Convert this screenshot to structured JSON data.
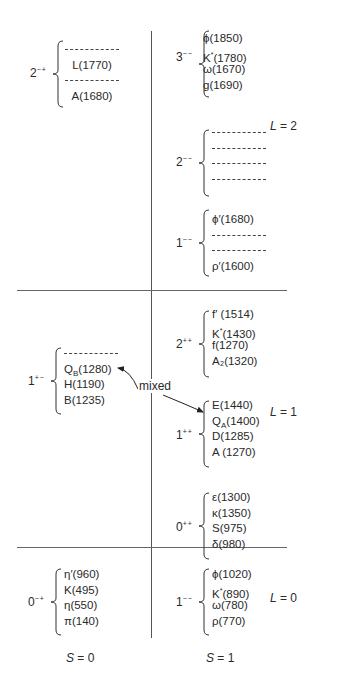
{
  "axes": {
    "spin_labels": [
      "S = 0",
      "S = 1"
    ],
    "orbital_labels": [
      "L = 2",
      "L = 1",
      "L = 0"
    ]
  },
  "groups": [
    {
      "id": "g-2mp",
      "jpc": "2",
      "pc": "−+",
      "items": [
        {
          "type": "dash"
        },
        {
          "type": "text",
          "text": "L(1770)"
        },
        {
          "type": "dash"
        },
        {
          "type": "text",
          "text": "A(1680)"
        }
      ]
    },
    {
      "id": "g-3mm",
      "jpc": "3",
      "pc": "−−",
      "items": [
        {
          "type": "text",
          "text": "ϕ(1850)"
        },
        {
          "type": "text",
          "text": "K*(1780)"
        },
        {
          "type": "text",
          "text": "ω(1670)"
        },
        {
          "type": "text",
          "text": "g(1690)"
        }
      ]
    },
    {
      "id": "g-2mm",
      "jpc": "2",
      "pc": "−−",
      "items": [
        {
          "type": "dash"
        },
        {
          "type": "dash"
        },
        {
          "type": "dash"
        },
        {
          "type": "dash"
        }
      ]
    },
    {
      "id": "g-1mm-L2",
      "jpc": "1",
      "pc": "−−",
      "items": [
        {
          "type": "text",
          "text": "ϕ′(1680)"
        },
        {
          "type": "dash"
        },
        {
          "type": "dash"
        },
        {
          "type": "text",
          "text": "ρ′(1600)"
        }
      ]
    },
    {
      "id": "g-1pm",
      "jpc": "1",
      "pc": "+−",
      "items": [
        {
          "type": "dash"
        },
        {
          "type": "text",
          "text": "Q_B(1280)"
        },
        {
          "type": "text",
          "text": "H(1190)"
        },
        {
          "type": "text",
          "text": "B(1235)"
        }
      ]
    },
    {
      "id": "g-2pp",
      "jpc": "2",
      "pc": "++",
      "items": [
        {
          "type": "text",
          "text": "f′ (1514)"
        },
        {
          "type": "text",
          "text": "K*(1430)"
        },
        {
          "type": "text",
          "text": "f(1270)"
        },
        {
          "type": "text",
          "text": "A₂(1320)"
        }
      ]
    },
    {
      "id": "g-1pp",
      "jpc": "1",
      "pc": "++",
      "items": [
        {
          "type": "text",
          "text": "E(1440)"
        },
        {
          "type": "text",
          "text": "Q_A(1400)"
        },
        {
          "type": "text",
          "text": "D(1285)"
        },
        {
          "type": "text",
          "text": "A (1270)"
        }
      ]
    },
    {
      "id": "g-0pp",
      "jpc": "0",
      "pc": "++",
      "items": [
        {
          "type": "text",
          "text": "ε(1300)"
        },
        {
          "type": "text",
          "text": "κ(1350)"
        },
        {
          "type": "text",
          "text": "S(975)"
        },
        {
          "type": "text",
          "text": "δ(980)"
        }
      ]
    },
    {
      "id": "g-0mp",
      "jpc": "0",
      "pc": "−+",
      "items": [
        {
          "type": "text",
          "text": "η′(960)"
        },
        {
          "type": "text",
          "text": "K(495)"
        },
        {
          "type": "text",
          "text": "η(550)"
        },
        {
          "type": "text",
          "text": "π(140)"
        }
      ]
    },
    {
      "id": "g-1mm-L0",
      "jpc": "1",
      "pc": "−−",
      "items": [
        {
          "type": "text",
          "text": "ϕ(1020)"
        },
        {
          "type": "text",
          "text": "K*(890)"
        },
        {
          "type": "text",
          "text": "ω(780)"
        },
        {
          "type": "text",
          "text": "ρ(770)"
        }
      ]
    }
  ],
  "annotations": {
    "mixed_label": "mixed",
    "mixed_connects": [
      "Q_B(1280)",
      "Q_A(1400)"
    ]
  }
}
